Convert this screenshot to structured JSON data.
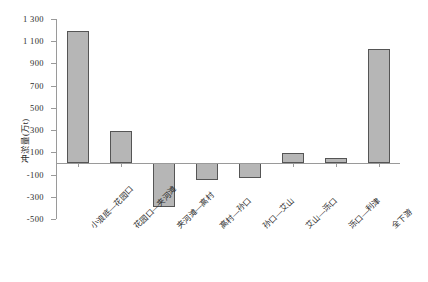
{
  "chart_data": {
    "type": "bar",
    "title": "",
    "xlabel": "",
    "ylabel": "冲淤量(万t)",
    "ylim": [
      -500,
      1300
    ],
    "ytick_step": 200,
    "grid": false,
    "legend": "none",
    "bar_color": "#b6b6b6",
    "bar_edge_color": "#555555",
    "axis_color": "#9a9a9a",
    "yticks": [
      "1 300",
      "1 100",
      "900",
      "700",
      "500",
      "300",
      "100",
      "-100",
      "-300",
      "-500"
    ],
    "ytick_values": [
      1300,
      1100,
      900,
      700,
      500,
      300,
      100,
      -100,
      -300,
      -500
    ],
    "categories": [
      "小浪底—花园口",
      "花园口—夹河滩",
      "夹河滩—高村",
      "高村—孙口",
      "孙口—艾山",
      "艾山—泺口",
      "泺口—利津",
      "全下游"
    ],
    "values": [
      1190,
      290,
      -390,
      -150,
      -130,
      90,
      50,
      1030
    ]
  }
}
